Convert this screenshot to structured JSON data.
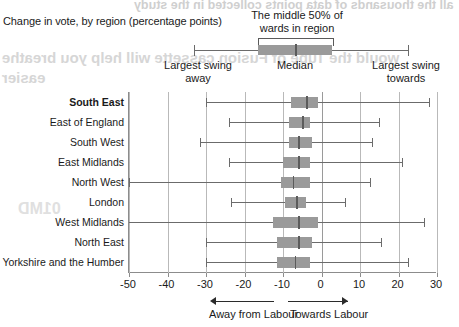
{
  "chart_data": {
    "type": "box",
    "title": "Change in vote, by region (percentage points)",
    "xlabel": "",
    "ylabel": "",
    "xlim": [
      -50,
      30
    ],
    "xticks": [
      -50,
      -40,
      -30,
      -20,
      -10,
      0,
      10,
      20,
      30
    ],
    "xtick_labels": [
      "-50",
      "-40",
      "-30",
      "-20",
      "-10",
      "0",
      "10",
      "20",
      "30"
    ],
    "grid": "vertical",
    "categories": [
      "South East",
      "East of England",
      "South West",
      "East Midlands",
      "North West",
      "London",
      "West Midlands",
      "North East",
      "Yorkshire and the Humber"
    ],
    "boxes": [
      {
        "region": "South East",
        "min": -30.0,
        "q1": -8.0,
        "median": -4.0,
        "q3": -1.0,
        "max": 28.0,
        "highlight": true
      },
      {
        "region": "East of England",
        "min": -24.0,
        "q1": -8.5,
        "median": -5.0,
        "q3": -3.0,
        "max": 15.0,
        "highlight": false
      },
      {
        "region": "South West",
        "min": -31.5,
        "q1": -8.5,
        "median": -6.0,
        "q3": -2.5,
        "max": 13.0,
        "highlight": false
      },
      {
        "region": "East Midlands",
        "min": -24.0,
        "q1": -10.0,
        "median": -6.0,
        "q3": -3.0,
        "max": 21.0,
        "highlight": false
      },
      {
        "region": "North West",
        "min": -50.0,
        "q1": -10.5,
        "median": -7.5,
        "q3": -3.0,
        "max": 12.5,
        "highlight": false
      },
      {
        "region": "London",
        "min": -23.5,
        "q1": -9.5,
        "median": -6.5,
        "q3": -4.0,
        "max": 6.0,
        "highlight": false
      },
      {
        "region": "West Midlands",
        "min": -50.5,
        "q1": -12.5,
        "median": -6.0,
        "q3": -1.0,
        "max": 26.5,
        "highlight": false
      },
      {
        "region": "North East",
        "min": -30.0,
        "q1": -11.5,
        "median": -6.0,
        "q3": -2.5,
        "max": 15.5,
        "highlight": false
      },
      {
        "region": "Yorkshire and the Humber",
        "min": -30.0,
        "q1": -11.5,
        "median": -7.0,
        "q3": -3.0,
        "max": 22.5,
        "highlight": false
      }
    ],
    "legend": {
      "box_caption_line1": "The middle 50% of",
      "box_caption_line2": "wards in region",
      "left_whisker_line1": "Largest swing",
      "left_whisker_line2": "away",
      "median_label": "Median",
      "right_whisker_line1": "Largest swing",
      "right_whisker_line2": "towards"
    },
    "annotations": {
      "left_arrow_label": "Away from Labour",
      "right_arrow_label": "Towards Labour"
    },
    "colors": {
      "box_fill": "#9a9a9a",
      "median_line": "#5b5b5b",
      "whisker": "#6b6b6b",
      "gridline": "#b9b9b9",
      "axis": "#8c8c8c",
      "text": "#1a1a1a"
    }
  },
  "ghost_text": {
    "line1": "all the thousands of data points collected in the study",
    "line2": "would the Tube of Fusion cassette will help you breathe",
    "line3": "easier",
    "line4": "01MD"
  }
}
